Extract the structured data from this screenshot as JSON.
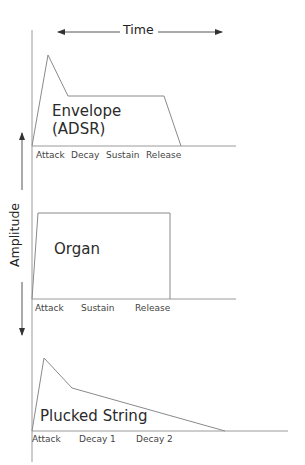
{
  "axes": {
    "time_label": "Time",
    "amplitude_label": "Amplitude"
  },
  "colors": {
    "line": "#8a8a8a",
    "text": "#333333",
    "background": "#ffffff"
  },
  "panels": [
    {
      "title_line1": "Envelope",
      "title_line2": "(ADSR)",
      "phases": [
        "Attack",
        "Decay",
        "Sustain",
        "Release"
      ]
    },
    {
      "title_line1": "Organ",
      "phases": [
        "Attack",
        "Sustain",
        "Release"
      ]
    },
    {
      "title_line1": "Plucked String",
      "phases": [
        "Attack",
        "Decay 1",
        "Decay 2"
      ]
    }
  ]
}
